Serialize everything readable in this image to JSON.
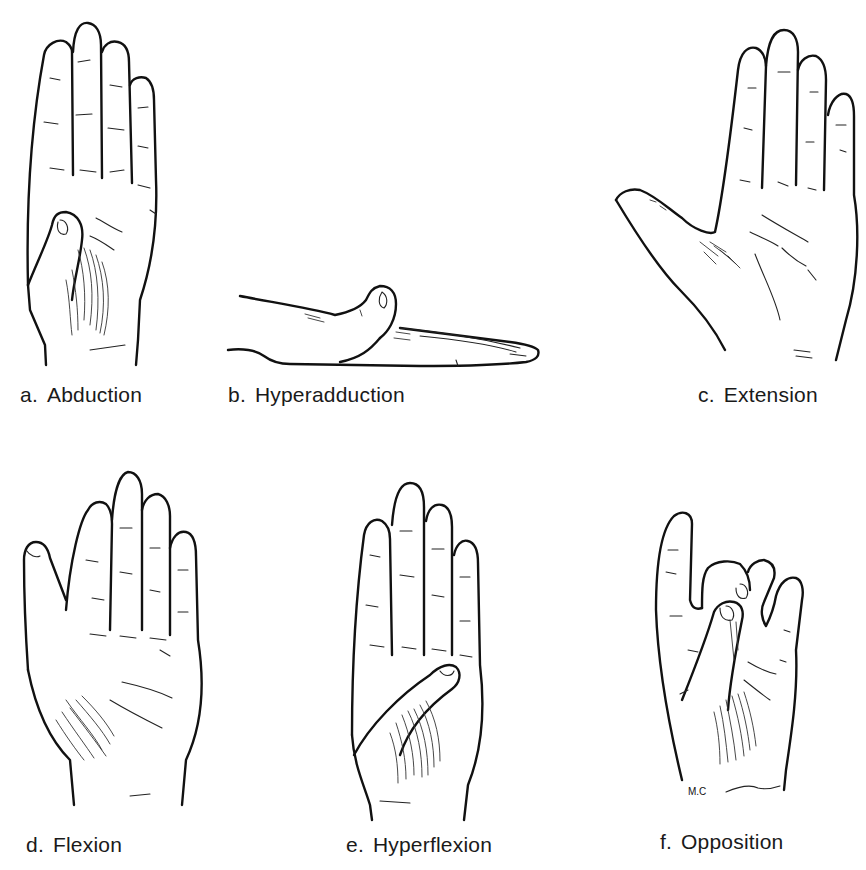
{
  "figure": {
    "panels": [
      {
        "id": "a",
        "letter": "a.",
        "label": "Abduction"
      },
      {
        "id": "b",
        "letter": "b.",
        "label": "Hyperadduction"
      },
      {
        "id": "c",
        "letter": "c.",
        "label": "Extension"
      },
      {
        "id": "d",
        "letter": "d.",
        "label": "Flexion"
      },
      {
        "id": "e",
        "letter": "e.",
        "label": "Hyperflexion"
      },
      {
        "id": "f",
        "letter": "f.",
        "label": "Opposition"
      }
    ],
    "signature": "M.C"
  }
}
